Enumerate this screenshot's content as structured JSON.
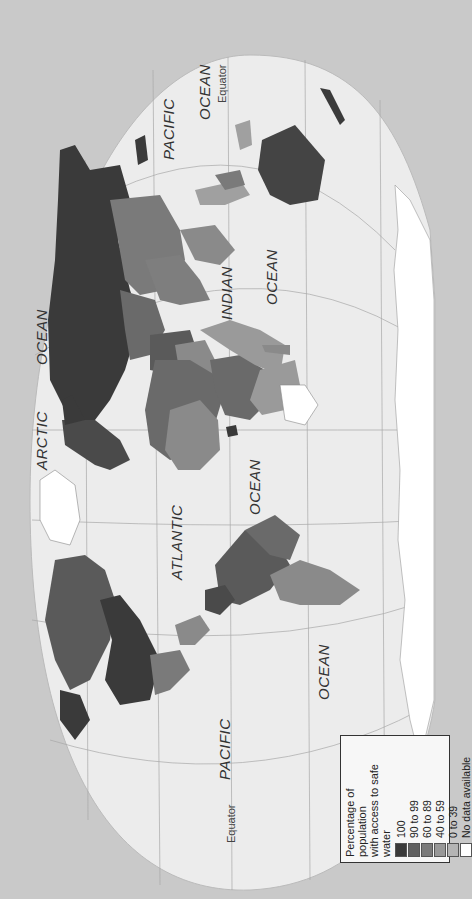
{
  "map": {
    "title": "Percentage of population with access to safe water",
    "orientation": "rotated 90 degrees counter-clockwise",
    "background_color": "#c9c9c9",
    "sea_color": "#ececec",
    "graticule_color": "#a0a0a0",
    "labels": {
      "pacific_east": "PACIFIC",
      "ocean_pacific_east": "OCEAN",
      "equator_east": "Equator",
      "indian": "INDIAN",
      "ocean_indian": "OCEAN",
      "arctic": "ARCTIC",
      "ocean_arctic": "OCEAN",
      "atlantic": "ATLANTIC",
      "ocean_atlantic": "OCEAN",
      "ocean_pacific_west": "OCEAN",
      "pacific_west": "PACIFIC",
      "equator_west": "Equator"
    }
  },
  "legend": {
    "title_line1": "Percentage of population",
    "title_line2": "with access to safe water",
    "items": [
      {
        "label": "100",
        "color": "#3a3a3a"
      },
      {
        "label": "90 to 99",
        "color": "#606060"
      },
      {
        "label": "60 to 89",
        "color": "#7a7a7a"
      },
      {
        "label": "40 to 59",
        "color": "#989898"
      },
      {
        "label": "0 to 39",
        "color": "#b4b4b4"
      },
      {
        "label": "No data available",
        "color": "#ffffff"
      }
    ]
  }
}
